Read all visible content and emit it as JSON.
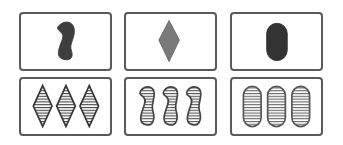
{
  "game": {
    "name": "Set card game",
    "colors": {
      "card_border": "#5a5a5a",
      "shape_gray": "#444444",
      "diamond_gray": "#777777",
      "stripe": "#444444"
    },
    "cards": [
      {
        "id": "card-1",
        "row": 0,
        "col": 0,
        "count": 1,
        "shape": "squiggle",
        "shading": "solid",
        "color": "gray",
        "label": "1 solid squiggle"
      },
      {
        "id": "card-2",
        "row": 0,
        "col": 1,
        "count": 1,
        "shape": "diamond",
        "shading": "solid",
        "color": "gray",
        "label": "1 solid diamond"
      },
      {
        "id": "card-3",
        "row": 0,
        "col": 2,
        "count": 1,
        "shape": "oval",
        "shading": "solid",
        "color": "gray",
        "label": "1 solid oval"
      },
      {
        "id": "card-4",
        "row": 1,
        "col": 0,
        "count": 3,
        "shape": "diamond",
        "shading": "striped",
        "color": "gray",
        "label": "3 striped diamonds"
      },
      {
        "id": "card-5",
        "row": 1,
        "col": 1,
        "count": 3,
        "shape": "squiggle",
        "shading": "striped",
        "color": "gray",
        "label": "3 striped squiggles"
      },
      {
        "id": "card-6",
        "row": 1,
        "col": 2,
        "count": 3,
        "shape": "oval",
        "shading": "striped",
        "color": "gray",
        "label": "3 striped ovals"
      }
    ]
  }
}
